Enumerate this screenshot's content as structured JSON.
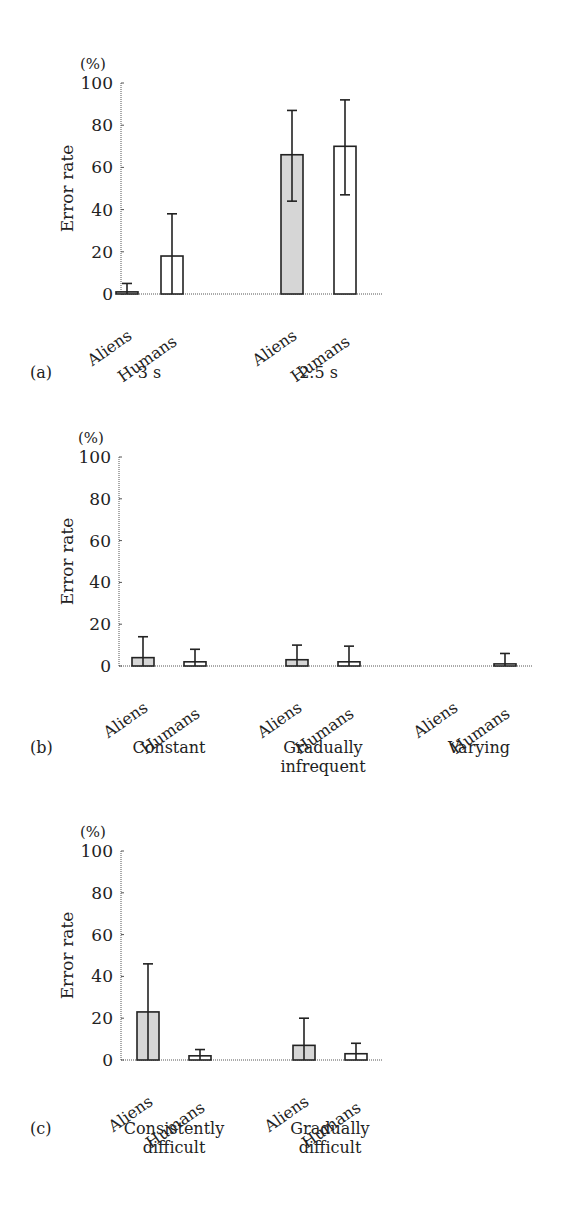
{
  "colors": {
    "aliens_fill": "#d6d6d6",
    "humans_fill": "#ffffff",
    "stroke": "#222222",
    "axis": "#555555"
  },
  "chart_data": [
    {
      "panel": "(a)",
      "type": "bar",
      "ylabel": "Error rate",
      "yunit": "(%)",
      "ylim": [
        0,
        100
      ],
      "yticks": [
        0,
        20,
        40,
        60,
        80,
        100
      ],
      "grid": false,
      "groups": [
        {
          "label": [
            "3 s"
          ],
          "bars": [
            {
              "name": "Aliens",
              "value": 1,
              "err_low": 0,
              "err_high": 5
            },
            {
              "name": "Humans",
              "value": 18,
              "err_low": 0,
              "err_high": 38
            }
          ]
        },
        {
          "label": [
            "2.5 s"
          ],
          "bars": [
            {
              "name": "Aliens",
              "value": 66,
              "err_low": 44,
              "err_high": 87
            },
            {
              "name": "Humans",
              "value": 70,
              "err_low": 47,
              "err_high": 92
            }
          ]
        }
      ]
    },
    {
      "panel": "(b)",
      "type": "bar",
      "ylabel": "Error rate",
      "yunit": "(%)",
      "ylim": [
        0,
        100
      ],
      "yticks": [
        0,
        20,
        40,
        60,
        80,
        100
      ],
      "grid": false,
      "groups": [
        {
          "label": [
            "Constant"
          ],
          "bars": [
            {
              "name": "Aliens",
              "value": 4,
              "err_low": 0,
              "err_high": 14
            },
            {
              "name": "Humans",
              "value": 2,
              "err_low": 0,
              "err_high": 8
            }
          ]
        },
        {
          "label": [
            "Gradually",
            "infrequent"
          ],
          "bars": [
            {
              "name": "Aliens",
              "value": 3,
              "err_low": 0,
              "err_high": 10
            },
            {
              "name": "Humans",
              "value": 2,
              "err_low": 0,
              "err_high": 9.5
            }
          ]
        },
        {
          "label": [
            "Varying"
          ],
          "bars": [
            {
              "name": "Aliens",
              "value": 0,
              "err_low": 0,
              "err_high": 0
            },
            {
              "name": "Humans",
              "value": 1,
              "err_low": 0,
              "err_high": 6
            }
          ]
        }
      ]
    },
    {
      "panel": "(c)",
      "type": "bar",
      "ylabel": "Error rate",
      "yunit": "(%)",
      "ylim": [
        0,
        100
      ],
      "yticks": [
        0,
        20,
        40,
        60,
        80,
        100
      ],
      "grid": false,
      "groups": [
        {
          "label": [
            "Consistently",
            "difficult"
          ],
          "bars": [
            {
              "name": "Aliens",
              "value": 23,
              "err_low": 0,
              "err_high": 46
            },
            {
              "name": "Humans",
              "value": 2,
              "err_low": 0,
              "err_high": 5
            }
          ]
        },
        {
          "label": [
            "Gradually",
            "difficult"
          ],
          "bars": [
            {
              "name": "Aliens",
              "value": 7,
              "err_low": 0,
              "err_high": 20
            },
            {
              "name": "Humans",
              "value": 3,
              "err_low": 0,
              "err_high": 8
            }
          ]
        }
      ]
    }
  ]
}
